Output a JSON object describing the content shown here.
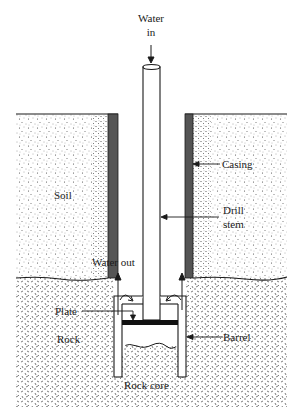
{
  "diagram": {
    "labels": {
      "water_in_line1": "Water",
      "water_in_line2": "in",
      "soil": "Soil",
      "casing": "Casing",
      "drill_stem_line1": "Drill",
      "drill_stem_line2": "stem",
      "water_out": "Water out",
      "plate": "Plate",
      "rock": "Rock",
      "barrel": "Barrel",
      "rock_core": "Rock core"
    },
    "colors": {
      "line": "#1a1a1a",
      "casing": "#555555",
      "plate": "#111111",
      "background": "#ffffff"
    }
  }
}
